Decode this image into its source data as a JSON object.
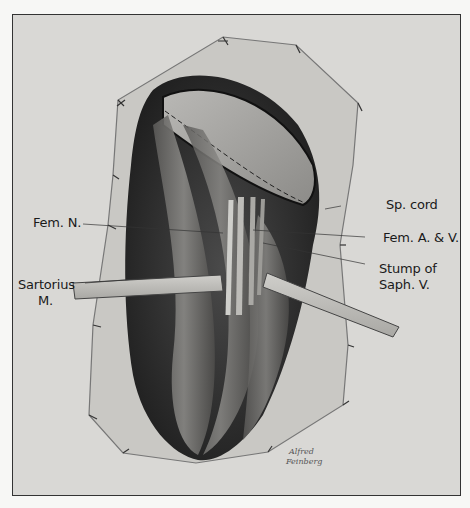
{
  "illustration": {
    "subject": "surgical anatomical pencil drawing of femoral region with retracted sartorius muscle",
    "colors": {
      "background": "#d9d8d5",
      "border": "#333333",
      "ink": "#1a1a1a",
      "shadow": "#2b2b2b"
    },
    "labels": {
      "fem_n": "Fem. N.",
      "sartorius_line1": "Sartorius",
      "sartorius_line2": "M.",
      "sp_cord": "Sp. cord",
      "fem_av": "Fem. A. & V.",
      "stump_line1": "Stump of",
      "stump_line2": "Saph. V."
    },
    "signature": {
      "line1": "Alfred",
      "line2": "Feinberg"
    }
  }
}
